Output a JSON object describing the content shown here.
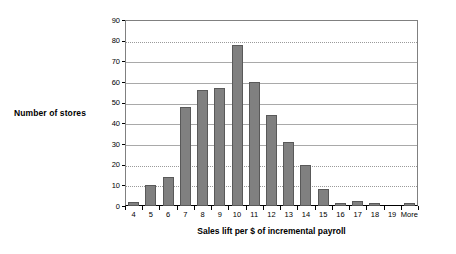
{
  "chart_data": {
    "type": "bar",
    "title": "",
    "xlabel": "Sales lift per $ of incremental payroll",
    "ylabel": "Number of stores",
    "categories": [
      "4",
      "5",
      "6",
      "7",
      "8",
      "9",
      "10",
      "11",
      "12",
      "13",
      "14",
      "15",
      "16",
      "17",
      "18",
      "19",
      "More"
    ],
    "values": [
      2,
      10,
      14,
      48,
      56,
      57,
      78,
      60,
      44,
      31,
      20,
      8,
      1.5,
      2.5,
      1.5,
      0,
      1.5
    ],
    "ylim": [
      0,
      90
    ],
    "ytick_labels": [
      "0",
      "10",
      "20",
      "30",
      "40",
      "50",
      "60",
      "70",
      "80",
      "90"
    ],
    "ytick_values": [
      0,
      10,
      20,
      30,
      40,
      50,
      60,
      70,
      80,
      90
    ],
    "grid": true,
    "legend": "none",
    "bar_color": "#808080",
    "bar_border_color": "#595959",
    "gridline_color": "#9a9a9a",
    "axis_color": "#000000",
    "plot_border_color": "#808080",
    "background": "#ffffff"
  }
}
